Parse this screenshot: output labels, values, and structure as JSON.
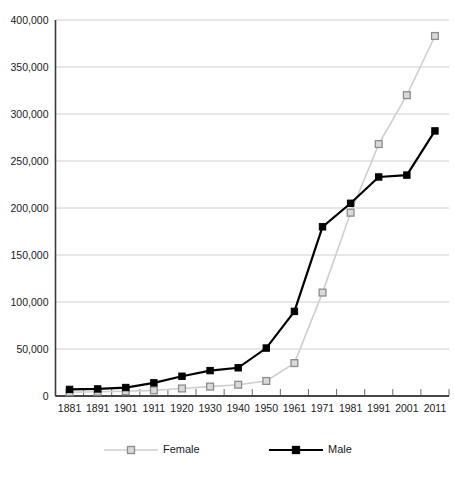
{
  "chart_data": {
    "type": "line",
    "title": "",
    "subtitle": "",
    "xlabel": "",
    "ylabel": "",
    "categories": [
      "1881",
      "1891",
      "1901",
      "1911",
      "1920",
      "1930",
      "1940",
      "1950",
      "1961",
      "1971",
      "1981",
      "1991",
      "2001",
      "2011"
    ],
    "series": [
      {
        "name": "Female",
        "color": "#cfcfcf",
        "marker": "open-square",
        "marker_fill": "#d9d9d9",
        "marker_stroke": "#8c8c8c",
        "values": [
          4000,
          4500,
          5000,
          6000,
          8000,
          10000,
          12000,
          16000,
          35000,
          110000,
          195000,
          268000,
          320000,
          383000
        ]
      },
      {
        "name": "Male",
        "color": "#000000",
        "marker": "filled-square",
        "marker_fill": "#000000",
        "marker_stroke": "#000000",
        "values": [
          7000,
          7500,
          9000,
          14000,
          21000,
          27000,
          30000,
          51000,
          90000,
          180000,
          205000,
          233000,
          235000,
          282000
        ]
      }
    ],
    "ylim": [
      0,
      400000
    ],
    "ytick_values": [
      0,
      50000,
      100000,
      150000,
      200000,
      250000,
      300000,
      350000,
      400000
    ],
    "ytick_labels": [
      "0",
      "50,000",
      "100,000",
      "150,000",
      "200,000",
      "250,000",
      "300,000",
      "350,000",
      "400,000"
    ],
    "grid": {
      "horizontal": true,
      "vertical": false,
      "color": "#d0d0d0"
    },
    "legend": {
      "position": "bottom",
      "entries": [
        {
          "label": "Female",
          "color": "#cfcfcf",
          "marker": "open-square"
        },
        {
          "label": "Male",
          "color": "#000000",
          "marker": "filled-square"
        }
      ]
    },
    "axes": {
      "axis_color": "#3a3a3a",
      "x_axis_ticks_between_categories": true
    },
    "background": "#ffffff"
  }
}
